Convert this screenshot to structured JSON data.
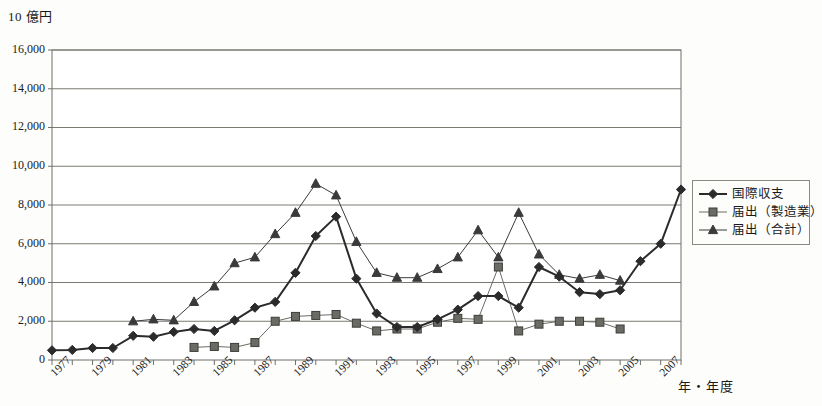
{
  "chart_data": {
    "type": "line",
    "title": "",
    "ylabel": "10 億円",
    "xlabel": "年・年度",
    "ylim": [
      0,
      16000
    ],
    "ytick_step": 2000,
    "ytick_labels": [
      "0",
      "2,000",
      "4,000",
      "6,000",
      "8,000",
      "10,000",
      "12,000",
      "14,000",
      "16,000"
    ],
    "grid": "horizontal",
    "legend_position": "right",
    "x_start": 1977,
    "x_end": 2008,
    "xtick_labels": [
      "1977",
      "1979",
      "1981",
      "1983",
      "1985",
      "1987",
      "1989",
      "1991",
      "1993",
      "1995",
      "1997",
      "1999",
      "2001",
      "2003",
      "2005",
      "2007"
    ],
    "x_all": [
      1977,
      1978,
      1979,
      1980,
      1981,
      1982,
      1983,
      1984,
      1985,
      1986,
      1987,
      1988,
      1989,
      1990,
      1991,
      1992,
      1993,
      1994,
      1995,
      1996,
      1997,
      1998,
      1999,
      2000,
      2001,
      2002,
      2003,
      2004,
      2005,
      2006,
      2007,
      2008
    ],
    "series": [
      {
        "name": "国際収支",
        "marker": "diamond",
        "color": "#2b2b2b",
        "line_width": 2,
        "x": [
          1977,
          1978,
          1979,
          1980,
          1981,
          1982,
          1983,
          1984,
          1985,
          1986,
          1987,
          1988,
          1989,
          1990,
          1991,
          1992,
          1993,
          1994,
          1995,
          1996,
          1997,
          1998,
          1999,
          2000,
          2001,
          2002,
          2003,
          2004,
          2005,
          2006,
          2007,
          2008
        ],
        "values": [
          500,
          520,
          620,
          620,
          1250,
          1200,
          1450,
          1600,
          1500,
          2050,
          2700,
          3000,
          4500,
          6400,
          7400,
          4200,
          2400,
          1700,
          1700,
          2100,
          2600,
          3300,
          3300,
          2700,
          4800,
          4300,
          3500,
          3400,
          3600,
          5100,
          6000,
          8800
        ]
      },
      {
        "name": "届出（製造業）",
        "marker": "square",
        "color": "#6b6b66",
        "line_width": 1,
        "x": [
          1984,
          1985,
          1986,
          1987,
          1988,
          1989,
          1990,
          1991,
          1992,
          1993,
          1994,
          1995,
          1996,
          1997,
          1998,
          1999,
          2000,
          2001,
          2002,
          2003,
          2004,
          2005
        ],
        "values": [
          650,
          700,
          650,
          900,
          2000,
          2250,
          2300,
          2350,
          1900,
          1500,
          1600,
          1600,
          1950,
          2150,
          2100,
          4800,
          1500,
          1850,
          2000,
          2000,
          1950,
          1600
        ]
      },
      {
        "name": "届出（合計）",
        "marker": "triangle",
        "color": "#3a3a3a",
        "line_width": 1,
        "x": [
          1981,
          1982,
          1983,
          1984,
          1985,
          1986,
          1987,
          1988,
          1989,
          1990,
          1991,
          1992,
          1993,
          1994,
          1995,
          1996,
          1997,
          1998,
          1999,
          2000,
          2001,
          2002,
          2003,
          2004,
          2005
        ],
        "values": [
          2000,
          2100,
          2050,
          3000,
          3800,
          5000,
          5300,
          6500,
          7600,
          9100,
          8500,
          6100,
          4500,
          4250,
          4250,
          4700,
          5300,
          6700,
          5300,
          7600,
          5450,
          4400,
          4200,
          4400,
          4100
        ]
      }
    ],
    "extra_points": [
      {
        "series": "国際収支",
        "x": 2008,
        "value": 13800,
        "note": "final-spike"
      }
    ]
  },
  "axis": {
    "unit_label": "10 億円",
    "x_caption": "年・年度"
  },
  "legend": {
    "items": [
      {
        "label": "国際収支",
        "marker": "diamond"
      },
      {
        "label": "届出（製造業）",
        "marker": "square"
      },
      {
        "label": "届出（合計）",
        "marker": "triangle"
      }
    ]
  }
}
